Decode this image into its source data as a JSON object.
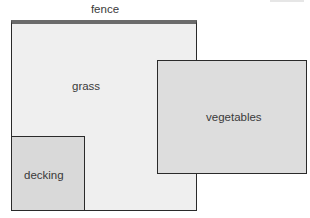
{
  "diagram": {
    "title_label": "fence",
    "areas": [
      {
        "id": "grass",
        "label": "grass",
        "color": "#efefef"
      },
      {
        "id": "vegetables",
        "label": "vegetables",
        "color": "#dddddd"
      },
      {
        "id": "decking",
        "label": "decking",
        "color": "#d9d9d9"
      }
    ],
    "fence_color": "#6b6b6b",
    "border_color": "#2a2a2a"
  }
}
